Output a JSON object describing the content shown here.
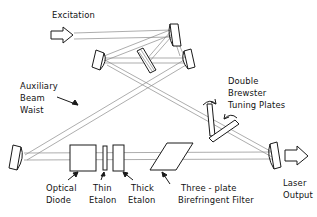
{
  "figure": {
    "type": "optical-ring-laser-cavity-diagram",
    "background_color": "#ffffff",
    "line_color": "#8a8a8a",
    "outline_color": "#1a1a1a",
    "text_color": "#111111"
  },
  "labels": {
    "excitation": "Excitation",
    "auxiliary_beam_waist": [
      "Auxiliary",
      "Beam",
      "Waist"
    ],
    "double_brewster_tuning_plates": [
      "Double",
      "Brewster",
      "Tuning  Plates"
    ],
    "optical_diode": [
      "Optical",
      "Diode"
    ],
    "thin_etalon": [
      "Thin",
      "Etalon"
    ],
    "thick_etalon": [
      "Thick",
      "Etalon"
    ],
    "three_plate_birefringent_filter": [
      "Three - plate",
      "Birefringent  Filter"
    ],
    "laser_output": [
      "Laser",
      "Output"
    ]
  },
  "components": {
    "mirror_top_right": "curved-mirror",
    "mirror_mid_left": "curved-mirror",
    "mirror_mid_right": "curved-mirror",
    "mirror_bottom_left": "curved-mirror",
    "mirror_output_coupler": "curved-mirror",
    "fold_element_center": "brewster-plate",
    "brewster_plate_vertical": "brewster-plate",
    "brewster_plate_tilted": "brewster-plate",
    "optical_diode": "square-plate",
    "thin_etalon": "narrow-plate",
    "thick_etalon": "rectangular-plate",
    "birefringent_filter": "parallelogram-plate",
    "excitation_arrow": "hollow-arrow-right",
    "output_arrow": "hollow-arrow-right"
  }
}
